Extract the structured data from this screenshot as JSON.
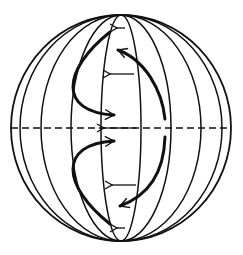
{
  "diagram": {
    "colors": {
      "line": "#111111",
      "background": "#ffffff"
    },
    "globe": {
      "cx": 121,
      "cy": 128,
      "rx": 110,
      "ry": 113
    },
    "meridians_rx": [
      110,
      101,
      80,
      50,
      20
    ],
    "equator": {
      "style": "dashed"
    },
    "small_arrows": [
      {
        "y": 28,
        "from_x": 125,
        "to_x": 117,
        "direction": "left"
      },
      {
        "y": 74,
        "from_x": 134,
        "to_x": 110,
        "direction": "left"
      },
      {
        "y": 128,
        "from_x": 136,
        "to_x": 104,
        "direction": "left"
      },
      {
        "y": 185,
        "from_x": 136,
        "to_x": 112,
        "direction": "left"
      },
      {
        "y": 228,
        "from_x": 125,
        "to_x": 117,
        "direction": "left"
      }
    ],
    "curved_arrows": [
      {
        "name": "upper-left-loop",
        "path": "M 110 32 C 62 70 58 112 114 115"
      },
      {
        "name": "lower-left-loop",
        "path": "M 110 224 C 62 186 58 144 114 141"
      },
      {
        "name": "upper-right-arc",
        "path": "M 165 119 C 162 90 145 60 118 50"
      },
      {
        "name": "lower-right-arc",
        "path": "M 165 137 C 164 170 150 195 120 206"
      }
    ]
  }
}
